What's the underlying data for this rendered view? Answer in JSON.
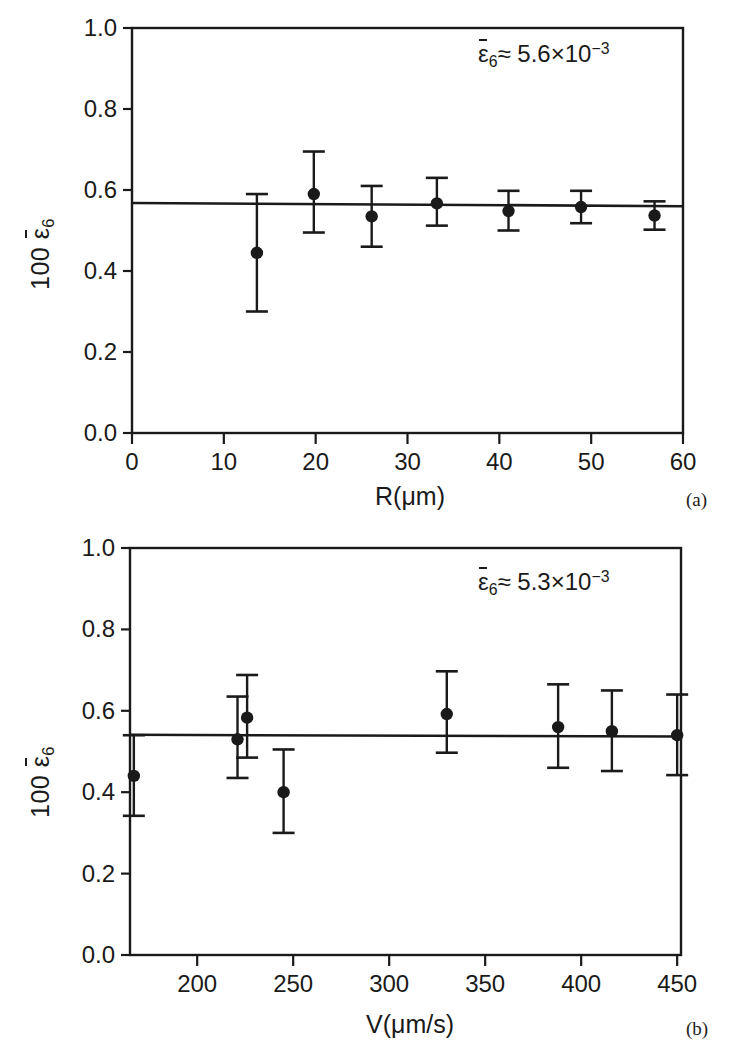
{
  "figure": {
    "y_axis_label_prefix": "100",
    "y_axis_label_symbol": "ε",
    "y_axis_label_sub": "6"
  },
  "panels": [
    {
      "tag": "(a)",
      "xlabel": "R(μm)",
      "annotation_symbol": "ε",
      "annotation_sub": "6",
      "annotation_rel": "≈ 5.6×10",
      "annotation_exp": "−3",
      "annotation_text": "ε̄6 ≈ 5.6×10⁻³"
    },
    {
      "tag": "(b)",
      "xlabel": "V(μm/s)",
      "annotation_symbol": "ε",
      "annotation_sub": "6",
      "annotation_rel": "≈ 5.3×10",
      "annotation_exp": "−3",
      "annotation_text": "ε̄6 ≈ 5.3×10⁻³"
    }
  ],
  "chart_data": [
    {
      "type": "scatter",
      "panel": "(a)",
      "title": "",
      "xlabel": "R(μm)",
      "ylabel": "100 ε̄6",
      "xlim": [
        0,
        60
      ],
      "ylim": [
        0.0,
        1.0
      ],
      "xticks": [
        0,
        10,
        20,
        30,
        40,
        50,
        60
      ],
      "xtick_labels": [
        "0",
        "10",
        "20",
        "30",
        "40",
        "50",
        "60"
      ],
      "yticks": [
        0.0,
        0.2,
        0.4,
        0.6,
        0.8,
        1.0
      ],
      "ytick_labels": [
        "0.0",
        "0.2",
        "0.4",
        "0.6",
        "0.8",
        "1.0"
      ],
      "grid": false,
      "legend": "none",
      "annotation": "ε̄6 ≈ 5.6×10⁻³",
      "x": [
        13.6,
        19.8,
        26.1,
        33.2,
        41.0,
        48.9,
        56.9
      ],
      "y": [
        0.445,
        0.59,
        0.535,
        0.567,
        0.548,
        0.558,
        0.537
      ],
      "yerr_upper": [
        0.145,
        0.105,
        0.075,
        0.063,
        0.05,
        0.04,
        0.035
      ],
      "yerr_lower": [
        0.145,
        0.095,
        0.075,
        0.055,
        0.048,
        0.04,
        0.035
      ],
      "fit_line": {
        "type": "linear",
        "y_at_xmin": 0.568,
        "y_at_xmax": 0.56
      }
    },
    {
      "type": "scatter",
      "panel": "(b)",
      "title": "",
      "xlabel": "V(μm/s)",
      "ylabel": "100 ε̄6",
      "xlim": [
        165,
        452
      ],
      "ylim": [
        0.0,
        1.0
      ],
      "xticks": [
        200,
        250,
        300,
        350,
        400,
        450
      ],
      "xtick_labels": [
        "200",
        "250",
        "300",
        "350",
        "400",
        "450"
      ],
      "yticks": [
        0.0,
        0.2,
        0.4,
        0.6,
        0.8,
        1.0
      ],
      "ytick_labels": [
        "0.0",
        "0.2",
        "0.4",
        "0.6",
        "0.8",
        "1.0"
      ],
      "grid": false,
      "legend": "none",
      "annotation": "ε̄6 ≈ 5.3×10⁻³",
      "x": [
        167,
        221,
        226,
        245,
        330,
        388,
        416,
        450
      ],
      "y": [
        0.44,
        0.53,
        0.583,
        0.4,
        0.592,
        0.56,
        0.55,
        0.54
      ],
      "yerr_upper": [
        0.1,
        0.105,
        0.105,
        0.105,
        0.105,
        0.105,
        0.1,
        0.1
      ],
      "yerr_lower": [
        0.098,
        0.095,
        0.098,
        0.1,
        0.095,
        0.1,
        0.098,
        0.098
      ],
      "fit_line": {
        "type": "linear",
        "y_at_xmin": 0.541,
        "y_at_xmax": 0.537
      }
    }
  ]
}
